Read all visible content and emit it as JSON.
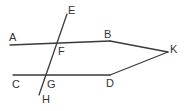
{
  "figure": {
    "background_color": "#ffffff",
    "stroke_color": "#3a3a3a",
    "label_color": "#333333",
    "width": 184,
    "height": 111
  },
  "points": [
    {
      "id": "A",
      "label": "A",
      "x": 9,
      "y": 32,
      "role": "ray-endpoint-label"
    },
    {
      "id": "E",
      "label": "E",
      "x": 68,
      "y": 5,
      "role": "ray-endpoint-label"
    },
    {
      "id": "B",
      "label": "B",
      "x": 104,
      "y": 29,
      "role": "vertex-label"
    },
    {
      "id": "K",
      "label": "K",
      "x": 170,
      "y": 44,
      "role": "vertex-label"
    },
    {
      "id": "F",
      "label": "F",
      "x": 58,
      "y": 46,
      "role": "intersection-label"
    },
    {
      "id": "C",
      "label": "C",
      "x": 12,
      "y": 79,
      "role": "ray-endpoint-label"
    },
    {
      "id": "G",
      "label": "G",
      "x": 47,
      "y": 79,
      "role": "intersection-label"
    },
    {
      "id": "D",
      "label": "D",
      "x": 106,
      "y": 78,
      "role": "vertex-label"
    },
    {
      "id": "H",
      "label": "H",
      "x": 42,
      "y": 94,
      "role": "ray-endpoint-label"
    }
  ],
  "segments": [
    {
      "id": "A-B",
      "from": "A",
      "to": "B",
      "x1": 10,
      "y1": 45,
      "x2": 110,
      "y2": 41
    },
    {
      "id": "B-K",
      "from": "B",
      "to": "K",
      "x1": 110,
      "y1": 41,
      "x2": 168,
      "y2": 52
    },
    {
      "id": "C-D",
      "from": "C",
      "to": "D",
      "x1": 13,
      "y1": 75,
      "x2": 110,
      "y2": 75
    },
    {
      "id": "D-K",
      "from": "D",
      "to": "K",
      "x1": 110,
      "y1": 75,
      "x2": 168,
      "y2": 52
    },
    {
      "id": "E-H",
      "from": "E",
      "to": "H",
      "x1": 67,
      "y1": 14,
      "x2": 39,
      "y2": 95
    }
  ]
}
